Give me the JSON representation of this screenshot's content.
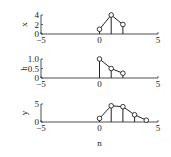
{
  "chart_data": [
    {
      "type": "stem",
      "ylabel": "x",
      "xlabel": "",
      "x": [
        0,
        1,
        2
      ],
      "values": [
        1,
        4,
        2
      ],
      "xlim": [
        -5,
        5
      ],
      "ylim": [
        0,
        4
      ],
      "xticks": [
        "-5",
        "0",
        "5"
      ],
      "yticks": [
        "0",
        "2",
        "4"
      ],
      "connected": true,
      "grid": false
    },
    {
      "type": "stem",
      "ylabel": "h",
      "xlabel": "",
      "x": [
        0,
        1,
        2
      ],
      "values": [
        1.0,
        0.5,
        0.25
      ],
      "xlim": [
        -5,
        5
      ],
      "ylim": [
        0,
        1.0
      ],
      "xticks": [
        "-5",
        "0",
        "5"
      ],
      "yticks": [
        "0",
        "0.5",
        "1.0"
      ],
      "connected": true,
      "grid": false
    },
    {
      "type": "stem",
      "ylabel": "y",
      "xlabel": "n",
      "x": [
        0,
        1,
        2,
        3,
        4
      ],
      "values": [
        1,
        4.5,
        4.25,
        2,
        0.5
      ],
      "xlim": [
        -5,
        5
      ],
      "ylim": [
        0,
        5
      ],
      "xticks": [
        "-5",
        "0",
        "5"
      ],
      "yticks": [
        "0",
        "5"
      ],
      "connected": true,
      "grid": false
    }
  ],
  "layout": {
    "axis_x_left": 41,
    "axis_x_right": 158,
    "panels": [
      {
        "baseline": 34,
        "top": 15
      },
      {
        "baseline": 78,
        "top": 59
      },
      {
        "baseline": 122,
        "top": 104
      }
    ],
    "xlabel_y": 146
  },
  "colors": {
    "line": "#222222",
    "marker_fill": "#ffffff"
  }
}
